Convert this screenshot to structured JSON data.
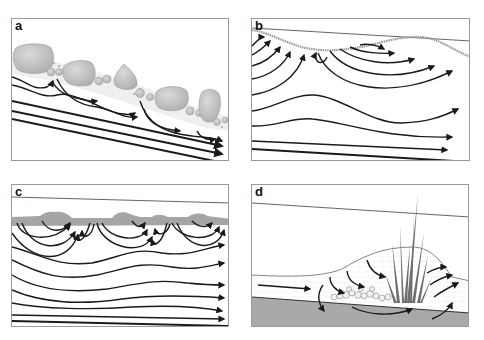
{
  "figure": {
    "panels": [
      {
        "id": "a",
        "label": "a",
        "description": "Step-pool / cobble bed on steep slope; flow paths dip under boulders and re-emerge downstream of each"
      },
      {
        "id": "b",
        "label": "b",
        "description": "Bedform (dune/riffle) induced hyporheic exchange: downwelling at crest region, upwelling at troughs; deeper flow lines parallel"
      },
      {
        "id": "c",
        "label": "c",
        "description": "Series of small bedforms on gray sediment layer; nested hyporheic flow cells between bedforms over regional undulating flow"
      },
      {
        "id": "d",
        "label": "d",
        "description": "Vegetation patch (reeds) with cobble deposit on bed; surface flow diverts downward into sediment and back upward behind the plants"
      }
    ]
  },
  "colors": {
    "background": "#ffffff",
    "panel_border": "#9a9a9a",
    "flow_lines": "#1a1a1a",
    "boulder_fill": "#c4c4c4",
    "sediment_fill": "#a8a8a8",
    "bed_surface": "#8a8a8a",
    "vegetation": "#6d6d6d"
  }
}
